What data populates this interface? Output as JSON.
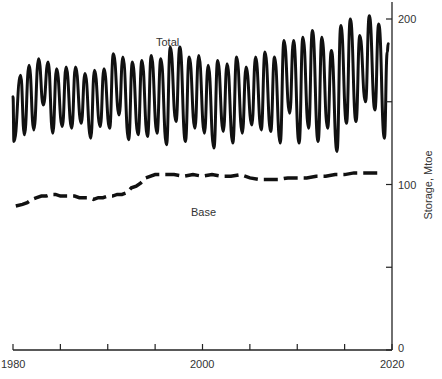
{
  "chart_data": {
    "type": "line",
    "title": "",
    "xlabel": "",
    "ylabel": "Storage, Mtoe",
    "xlim": [
      1980,
      2020
    ],
    "ylim": [
      0,
      200
    ],
    "x_ticks": [
      1980,
      1985,
      1990,
      1995,
      2000,
      2005,
      2010,
      2015,
      2020
    ],
    "x_tick_labels": [
      {
        "value": 1980,
        "label": "1980"
      },
      {
        "value": 2000,
        "label": "2000"
      },
      {
        "value": 2020,
        "label": "2020"
      }
    ],
    "y_ticks": [
      0,
      50,
      100,
      150,
      200
    ],
    "y_tick_labels": [
      {
        "value": 0,
        "label": "0"
      },
      {
        "value": 100,
        "label": "100"
      },
      {
        "value": 200,
        "label": "200"
      }
    ],
    "y_axis_position": "right",
    "grid": false,
    "legend": "inline labels",
    "annotations": [
      {
        "text": "Total",
        "x": 1995.0,
        "y": 188
      },
      {
        "text": "Base",
        "x": 1999.0,
        "y": 95
      }
    ],
    "series": [
      {
        "name": "Total",
        "style": "solid",
        "color": "#111111",
        "x": [
          1980.0,
          1980.1,
          1980.8,
          1981.2,
          1981.7,
          1982.2,
          1982.7,
          1983.2,
          1983.7,
          1984.2,
          1984.6,
          1985.2,
          1985.6,
          1986.2,
          1986.6,
          1987.2,
          1987.6,
          1988.2,
          1988.6,
          1989.2,
          1989.6,
          1990.2,
          1990.6,
          1991.2,
          1991.6,
          1992.2,
          1992.6,
          1993.2,
          1993.6,
          1994.2,
          1994.6,
          1995.2,
          1995.6,
          1996.2,
          1996.6,
          1997.2,
          1997.6,
          1998.2,
          1998.6,
          1999.2,
          1999.6,
          2000.2,
          2000.6,
          2001.2,
          2001.6,
          2002.2,
          2002.6,
          2003.2,
          2003.6,
          2004.2,
          2004.6,
          2005.2,
          2005.6,
          2006.2,
          2006.6,
          2007.2,
          2007.6,
          2008.2,
          2008.6,
          2009.2,
          2009.6,
          2010.2,
          2010.6,
          2011.2,
          2011.6,
          2012.2,
          2012.6,
          2013.2,
          2013.6,
          2014.2,
          2014.6,
          2015.2,
          2015.6,
          2016.2,
          2016.6,
          2017.2,
          2017.6,
          2018.2,
          2018.6,
          2019.2,
          2019.5,
          2019.6
        ],
        "values": [
          153,
          126,
          166,
          130,
          172,
          133,
          176,
          148,
          174,
          131,
          170,
          135,
          171,
          134,
          171,
          137,
          167,
          128,
          169,
          135,
          170,
          134,
          179,
          142,
          177,
          127,
          174,
          130,
          175,
          129,
          178,
          131,
          176,
          124,
          183,
          138,
          183,
          126,
          177,
          134,
          178,
          131,
          172,
          122,
          175,
          132,
          173,
          125,
          177,
          131,
          171,
          136,
          177,
          133,
          180,
          132,
          177,
          125,
          187,
          143,
          187,
          125,
          189,
          134,
          193,
          126,
          189,
          134,
          181,
          120,
          196,
          137,
          200,
          138,
          190,
          150,
          202,
          145,
          197,
          128,
          180,
          185
        ]
      },
      {
        "name": "Base",
        "style": "dashed",
        "color": "#111111",
        "x": [
          1980.3,
          1981.0,
          1981.5,
          1982.0,
          1982.5,
          1983.0,
          1983.5,
          1984.0,
          1984.5,
          1985.0,
          1985.5,
          1986.0,
          1986.5,
          1987.0,
          1987.5,
          1988.0,
          1988.5,
          1989.0,
          1989.5,
          1990.0,
          1990.5,
          1991.0,
          1991.5,
          1992.0,
          1992.5,
          1993.0,
          1993.5,
          1994.0,
          1995.0,
          1996.0,
          1997.0,
          1998.0,
          1999.0,
          2000.0,
          2001.0,
          2002.0,
          2003.0,
          2004.0,
          2005.0,
          2006.0,
          2007.0,
          2008.0,
          2009.0,
          2010.0,
          2011.0,
          2012.0,
          2013.0,
          2014.0,
          2015.0,
          2016.0,
          2017.0,
          2018.0,
          2019.0
        ],
        "values": [
          87,
          88,
          89,
          91,
          92,
          93,
          93,
          94,
          94,
          93,
          93,
          93,
          93,
          92,
          92,
          92,
          91,
          92,
          92,
          93,
          93,
          94,
          94,
          95,
          98,
          99,
          101,
          104,
          106,
          106,
          106,
          105,
          106,
          105,
          106,
          105,
          105,
          106,
          104,
          103,
          103,
          103,
          104,
          104,
          104,
          105,
          105,
          106,
          106,
          107,
          107,
          107,
          107
        ]
      }
    ]
  },
  "labels": {
    "total": "Total",
    "base": "Base",
    "y_axis_title": "Storage, Mtoe",
    "x_tick_1980": "1980",
    "x_tick_2000": "2000",
    "x_tick_2020": "2020",
    "y_tick_0": "0",
    "y_tick_100": "100",
    "y_tick_200": "200"
  },
  "colors": {
    "line": "#111111",
    "axis": "#222222",
    "text": "#333333"
  }
}
